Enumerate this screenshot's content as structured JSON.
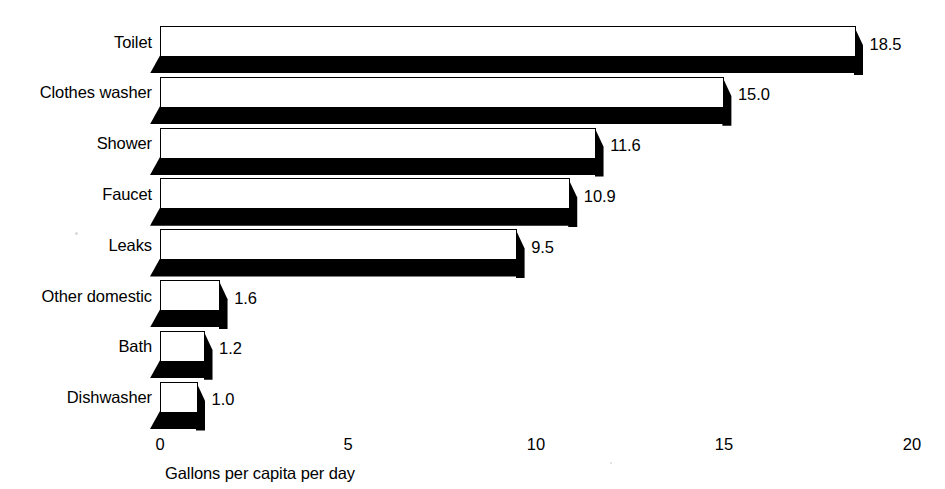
{
  "chart_data": {
    "type": "bar",
    "orientation": "horizontal",
    "title": "",
    "xlabel": "Gallons per capita per day",
    "ylabel": "",
    "xlim": [
      0,
      20
    ],
    "xticks": [
      "0",
      "5",
      "10",
      "15",
      "20"
    ],
    "xtick_values": [
      0,
      5,
      10,
      15,
      20
    ],
    "grid": false,
    "legend": false,
    "categories": [
      "Toilet",
      "Clothes washer",
      "Shower",
      "Faucet",
      "Leaks",
      "Other domestic",
      "Bath",
      "Dishwasher"
    ],
    "values": [
      18.5,
      15.0,
      11.6,
      10.9,
      9.5,
      1.6,
      1.2,
      1.0
    ],
    "value_labels": [
      "18.5",
      "15.0",
      "11.6",
      "10.9",
      "9.5",
      "1.6",
      "1.2",
      "1.0"
    ],
    "colors": {
      "bar_face": "#ffffff",
      "bar_edge": "#000000",
      "bar_depth": "#000000",
      "text": "#000000",
      "background": "#ffffff"
    }
  }
}
